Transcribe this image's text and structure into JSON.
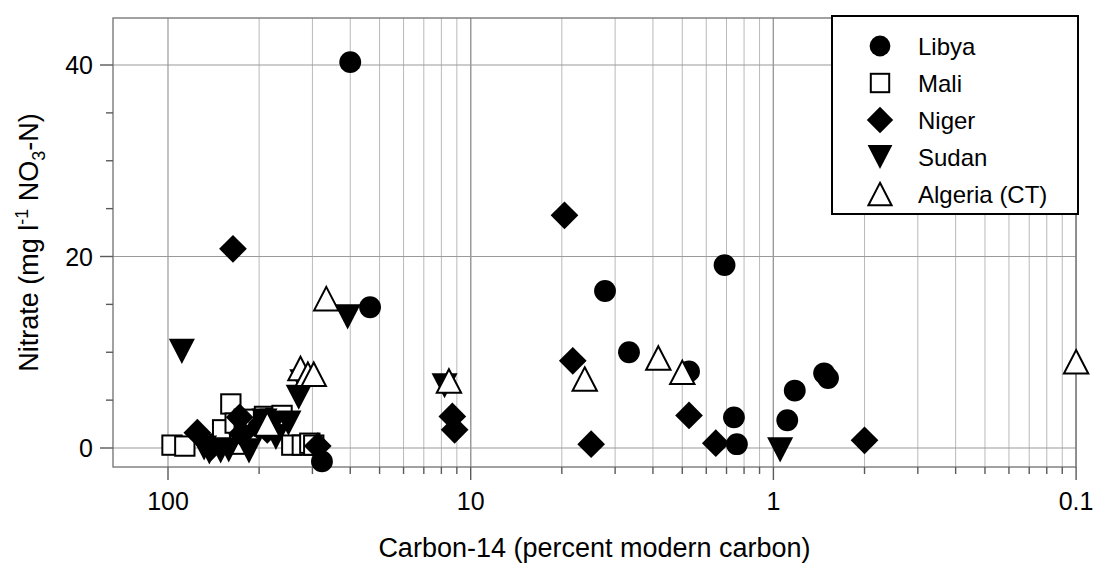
{
  "chart_data": {
    "type": "scatter",
    "title": "",
    "xlabel": "Carbon-14 (percent modern carbon)",
    "ylabel": "Nitrate (mg l-1 NO3-N)",
    "ylabel_parts": {
      "prefix": "Nitrate (mg l",
      "sup": "-1",
      "mid": " NO",
      "sub": "3",
      "suffix": "-N)"
    },
    "x_scale": "log-reversed",
    "xlim": [
      100,
      0.1
    ],
    "ylim": [
      -3,
      44
    ],
    "x_ticks": [
      "100",
      "10",
      "1",
      "0.1"
    ],
    "x_tick_values": [
      100,
      10,
      1,
      0.1
    ],
    "y_ticks": [
      "0",
      "20",
      "40"
    ],
    "y_tick_values": [
      0,
      20,
      40
    ],
    "y_minor_step": 5,
    "grid": "both-minor-vertical-major-horizontal",
    "legend_position": "top-right",
    "series": [
      {
        "name": "Libya",
        "marker": "filled-circle",
        "color": "#000000",
        "points": [
          [
            25.0,
            40.3
          ],
          [
            21.5,
            14.7
          ],
          [
            3.6,
            16.4
          ],
          [
            3.0,
            10.0
          ],
          [
            1.9,
            8.0
          ],
          [
            1.45,
            19.1
          ],
          [
            1.35,
            3.2
          ],
          [
            1.32,
            0.4
          ],
          [
            0.68,
            7.8
          ],
          [
            0.66,
            7.3
          ],
          [
            0.85,
            6.0
          ],
          [
            0.9,
            2.9
          ],
          [
            31.0,
            -1.4
          ]
        ]
      },
      {
        "name": "Mali",
        "marker": "open-square",
        "color": "#000000",
        "points": [
          [
            97.0,
            0.3
          ],
          [
            88.0,
            0.2
          ],
          [
            70.0,
            0.4
          ],
          [
            66.0,
            1.9
          ],
          [
            62.0,
            4.6
          ],
          [
            60.0,
            2.6
          ],
          [
            58.0,
            0.4
          ],
          [
            52.0,
            2.8
          ],
          [
            48.0,
            3.3
          ],
          [
            46.0,
            3.0
          ],
          [
            44.0,
            3.1
          ],
          [
            42.0,
            3.4
          ],
          [
            39.0,
            0.3
          ],
          [
            36.0,
            0.3
          ],
          [
            34.0,
            0.5
          ],
          [
            33.0,
            0.3
          ],
          [
            56.0,
            3.0
          ]
        ]
      },
      {
        "name": "Niger",
        "marker": "filled-diamond",
        "color": "#000000",
        "points": [
          [
            80.0,
            1.6
          ],
          [
            72.0,
            0.1
          ],
          [
            61.0,
            20.8
          ],
          [
            58.0,
            3.2
          ],
          [
            57.0,
            1.5
          ],
          [
            50.0,
            2.2
          ],
          [
            49.0,
            2.6
          ],
          [
            47.0,
            1.9
          ],
          [
            32.0,
            0.2
          ],
          [
            11.5,
            3.3
          ],
          [
            11.3,
            1.9
          ],
          [
            4.9,
            24.3
          ],
          [
            4.6,
            9.1
          ],
          [
            4.0,
            0.4
          ],
          [
            1.55,
            0.5
          ],
          [
            1.9,
            3.4
          ],
          [
            0.5,
            0.8
          ]
        ]
      },
      {
        "name": "Sudan",
        "marker": "filled-triangle-down",
        "color": "#000000",
        "points": [
          [
            90.0,
            10.1
          ],
          [
            76.0,
            0.0
          ],
          [
            73.0,
            -0.4
          ],
          [
            67.0,
            -0.3
          ],
          [
            63.0,
            -0.2
          ],
          [
            54.0,
            -0.3
          ],
          [
            48.0,
            2.8
          ],
          [
            46.0,
            2.5
          ],
          [
            45.0,
            2.3
          ],
          [
            44.0,
            1.1
          ],
          [
            40.0,
            2.6
          ],
          [
            37.0,
            5.3
          ],
          [
            36.0,
            6.9
          ],
          [
            25.5,
            13.7
          ],
          [
            12.2,
            6.5
          ],
          [
            0.95,
            -0.2
          ]
        ]
      },
      {
        "name": "Algeria (CT)",
        "marker": "open-triangle-up",
        "color": "#000000",
        "points": [
          [
            47.0,
            2.5
          ],
          [
            36.5,
            8.3
          ],
          [
            34.5,
            7.7
          ],
          [
            33.0,
            7.7
          ],
          [
            30.0,
            15.6
          ],
          [
            11.8,
            7.0
          ],
          [
            4.2,
            7.2
          ],
          [
            2.4,
            9.4
          ],
          [
            2.0,
            7.9
          ],
          [
            0.1,
            9.0
          ]
        ]
      }
    ]
  },
  "legend": {
    "entries": [
      {
        "label": "Libya",
        "marker": "filled-circle"
      },
      {
        "label": "Mali",
        "marker": "open-square"
      },
      {
        "label": "Niger",
        "marker": "filled-diamond"
      },
      {
        "label": "Sudan",
        "marker": "filled-triangle-down"
      },
      {
        "label": "Algeria (CT)",
        "marker": "open-triangle-up"
      }
    ]
  }
}
